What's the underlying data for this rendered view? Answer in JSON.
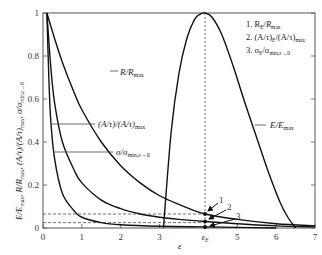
{
  "chart_data": {
    "type": "line",
    "title": "",
    "xlabel": "ε",
    "ylabel": "E/E_max , R/R_max , (A/τ)/(A/τ)_max , σ/σ_min,ε→0",
    "xlim": [
      0,
      7
    ],
    "ylim": [
      0,
      1
    ],
    "x_ticks": [
      "0",
      "1",
      "2",
      "3",
      "ε_E",
      "5",
      "6",
      "7"
    ],
    "x_tick_values": [
      0,
      1,
      2,
      3,
      4.17,
      5,
      6,
      7
    ],
    "y_ticks": [
      "0",
      "0.2",
      "0.4",
      "0.6",
      "0.8",
      "1"
    ],
    "y_tick_values": [
      0,
      0.2,
      0.4,
      0.6,
      0.8,
      1
    ],
    "grid": false,
    "epsilon_E": 4.17,
    "series": [
      {
        "name": "R/R_max",
        "label": "R/R_max",
        "x": [
          0.1,
          0.3,
          0.5,
          0.8,
          1.0,
          1.5,
          2.0,
          2.5,
          3.0,
          3.5,
          4.17,
          5.0,
          6.0,
          7.0
        ],
        "y": [
          1.0,
          0.88,
          0.77,
          0.63,
          0.55,
          0.4,
          0.29,
          0.21,
          0.15,
          0.11,
          0.065,
          0.04,
          0.02,
          0.01
        ]
      },
      {
        "name": "(A/τ)/(A/τ)_max",
        "label": "(A/τ)/(A/τ)_max",
        "x": [
          0.1,
          0.2,
          0.3,
          0.5,
          0.8,
          1.0,
          1.5,
          2.0,
          2.5,
          3.0,
          3.5,
          4.17,
          5.0,
          6.0,
          7.0
        ],
        "y": [
          1.0,
          0.75,
          0.58,
          0.4,
          0.27,
          0.21,
          0.13,
          0.09,
          0.065,
          0.05,
          0.04,
          0.03,
          0.02,
          0.01,
          0.005
        ]
      },
      {
        "name": "σ/σ_min,ε→0",
        "label": "σ/σ_min,ε→0",
        "x": [
          0.1,
          0.15,
          0.2,
          0.3,
          0.5,
          0.8,
          1.0,
          1.5,
          2.0,
          3.0,
          4.17,
          5.0,
          6.0
        ],
        "y": [
          1.0,
          0.7,
          0.5,
          0.32,
          0.16,
          0.08,
          0.05,
          0.025,
          0.015,
          0.008,
          0.005,
          0.003,
          0.0
        ]
      },
      {
        "name": "E/E_max",
        "label": "E/E_max",
        "x": [
          3.1,
          3.3,
          3.5,
          3.7,
          3.9,
          4.05,
          4.17,
          4.35,
          4.6,
          4.9,
          5.2,
          5.5,
          5.8,
          6.1,
          6.3,
          6.5
        ],
        "y": [
          0.0,
          0.45,
          0.72,
          0.88,
          0.97,
          0.995,
          1.0,
          0.98,
          0.9,
          0.75,
          0.58,
          0.42,
          0.26,
          0.12,
          0.05,
          0.0
        ]
      }
    ],
    "annotations": [
      {
        "marker": "1",
        "text": "R_E/R_max",
        "x": 4.17,
        "y": 0.065
      },
      {
        "marker": "2",
        "text": "(A/τ)_E/(A/τ)_max",
        "x": 4.17,
        "y": 0.03
      },
      {
        "marker": "3",
        "text": "σ_E/σ_min,ε→0",
        "x": 4.17,
        "y": 0.005
      }
    ],
    "reference_lines": [
      {
        "type": "vertical",
        "style": "dashed",
        "x": 4.17
      },
      {
        "type": "horizontal",
        "style": "dashed",
        "y": 0.065
      },
      {
        "type": "horizontal",
        "style": "dashed",
        "y": 0.025
      }
    ],
    "legend": {
      "position": "top-right",
      "entries": [
        "1. R_E/R_max",
        "2. (A/τ)_E/(A/τ)_max",
        "3. σ_E/σ_min,ε→0"
      ]
    }
  },
  "labels": {
    "x_axis": "ε",
    "y_axis_main": "E/E",
    "curve_R": "R/R",
    "curve_A": "(A/τ)/(A/τ)",
    "curve_sigma": "σ/σ",
    "curve_E": "E/E",
    "legend_1": "1. R",
    "legend_2": "2. (A/τ)",
    "legend_3": "3. σ",
    "marker_1": "1",
    "marker_2": "2",
    "marker_3": "3"
  }
}
